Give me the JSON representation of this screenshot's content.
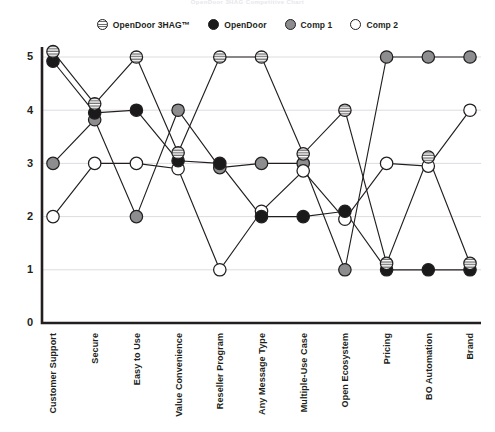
{
  "title": "OpenDoor 3HAG Competitive Chart",
  "legend": {
    "position": "top-center",
    "items": [
      {
        "label": "OpenDoor 3HAG™",
        "marker": "striped-circle-icon",
        "color": "#ffffff"
      },
      {
        "label": "OpenDoor",
        "marker": "filled-black-circle-icon",
        "color": "#1a1a1a"
      },
      {
        "label": "Comp 1",
        "marker": "filled-grey-circle-icon",
        "color": "#8d8d90"
      },
      {
        "label": "Comp 2",
        "marker": "open-white-circle-icon",
        "color": "#ffffff"
      }
    ]
  },
  "chart_data": {
    "type": "line",
    "title": "OpenDoor 3HAG Competitive Chart",
    "xlabel": "",
    "ylabel": "",
    "ylim": [
      0,
      5
    ],
    "yticks": [
      "0",
      "1",
      "2",
      "3",
      "4",
      "5"
    ],
    "grid": true,
    "categories": [
      "Customer Support",
      "Secure",
      "Easy to Use",
      "Value Convenience",
      "Reseller Program",
      "Any Message Type",
      "Multiple-Use Case",
      "Open Ecosystem",
      "Pricing",
      "BO Automation",
      "Brand"
    ],
    "series": [
      {
        "name": "OpenDoor 3HAG™",
        "marker": "striped-circle-icon",
        "color": "#ffffff",
        "values": [
          5.1,
          4.12,
          5,
          3.2,
          5,
          5,
          3.18,
          4,
          1.12,
          3.12,
          1.12
        ]
      },
      {
        "name": "OpenDoor",
        "marker": "filled-black-circle-icon",
        "color": "#1a1a1a",
        "values": [
          4.92,
          3.95,
          4,
          3.05,
          3,
          2,
          2,
          2.1,
          1,
          1,
          1
        ]
      },
      {
        "name": "Comp 1",
        "marker": "filled-grey-circle-icon",
        "color": "#8d8d90",
        "values": [
          3,
          3.82,
          2,
          4,
          2.92,
          3,
          3,
          1,
          5,
          5,
          5
        ]
      },
      {
        "name": "Comp 2",
        "marker": "open-white-circle-icon",
        "color": "#ffffff",
        "values": [
          2,
          3,
          3,
          2.9,
          1,
          2.1,
          2.86,
          1.95,
          3,
          2.95,
          4
        ]
      }
    ]
  },
  "colors": {
    "axis": "#231f20",
    "grid": "#d9d9de",
    "background": "#ffffff"
  }
}
